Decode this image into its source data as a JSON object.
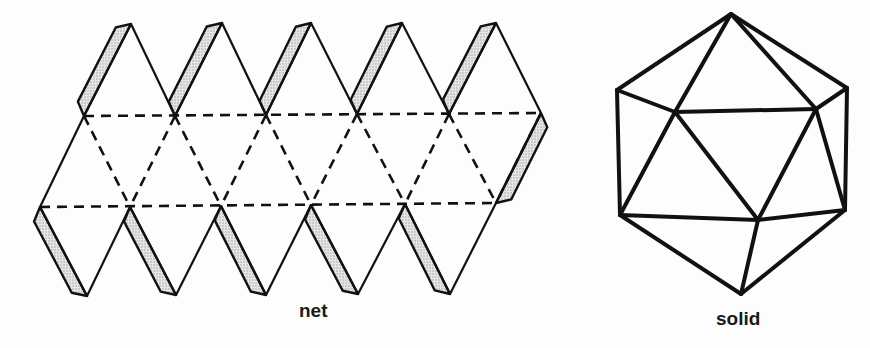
{
  "figure": {
    "labels": {
      "net": "net",
      "solid": "solid"
    },
    "net": {
      "faces": 20,
      "glue_tabs": 11,
      "fold_lines": "dashed",
      "cut_lines": "solid",
      "tab_fill": "#d0d0d0"
    },
    "solid": {
      "visible_edges": "solid"
    },
    "colors": {
      "line": "#111111",
      "background": "#fdfdfd",
      "tab_fill": "#d0d0d0"
    }
  }
}
